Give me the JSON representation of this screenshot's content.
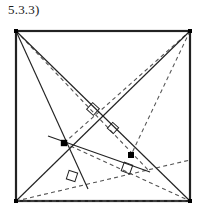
{
  "figure": {
    "label": "5.3.3)",
    "label_position": {
      "x": 8,
      "y": 2
    },
    "canvas": {
      "width": 206,
      "height": 221,
      "background": "#ffffff"
    },
    "stroke_color": "#222222",
    "dash_color": "#555555",
    "point_color": "#000000"
  },
  "square": {
    "name": "outer-square",
    "stroke": "#222222",
    "stroke_width": 2.2,
    "corners": {
      "top_left": {
        "x": 16,
        "y": 31
      },
      "top_right": {
        "x": 190,
        "y": 31
      },
      "bottom_left": {
        "x": 16,
        "y": 201
      },
      "bottom_right": {
        "x": 190,
        "y": 201
      }
    }
  },
  "solid_lines": [
    {
      "name": "diagonal-tl-br",
      "x1": 16,
      "y1": 31,
      "x2": 190,
      "y2": 201
    },
    {
      "name": "line-tr-to-bl",
      "x1": 190,
      "y1": 31,
      "x2": 16,
      "y2": 201
    },
    {
      "name": "cevian-tl-down",
      "x1": 16,
      "y1": 31,
      "x2": 88,
      "y2": 189
    },
    {
      "name": "segment-node-to-right",
      "x1": 48,
      "y1": 136,
      "x2": 150,
      "y2": 172
    }
  ],
  "dashed_lines": [
    {
      "name": "dashed-tl-to-lower-right",
      "x1": 16,
      "y1": 31,
      "x2": 150,
      "y2": 172
    },
    {
      "name": "dashed-tr-to-node-q",
      "x1": 190,
      "y1": 31,
      "x2": 131,
      "y2": 155
    },
    {
      "name": "dashed-bl-to-br",
      "x1": 16,
      "y1": 201,
      "x2": 190,
      "y2": 201
    },
    {
      "name": "dashed-bl-diag-to-right",
      "x1": 16,
      "y1": 201,
      "x2": 190,
      "y2": 160
    },
    {
      "name": "dashed-node-p-to-tr",
      "x1": 64,
      "y1": 143,
      "x2": 190,
      "y2": 31
    },
    {
      "name": "dashed-node-p-to-br",
      "x1": 64,
      "y1": 143,
      "x2": 190,
      "y2": 201
    }
  ],
  "points": [
    {
      "name": "point-p-center",
      "x": 64,
      "y": 143,
      "radius": 3.2,
      "label": ""
    },
    {
      "name": "point-q-right",
      "x": 131,
      "y": 155,
      "radius": 3.0,
      "label": ""
    }
  ],
  "right_angle_markers": [
    {
      "name": "right-angle-upper",
      "cx": 93,
      "cy": 109,
      "size": 9,
      "rotation": 42
    },
    {
      "name": "right-angle-mid-left",
      "cx": 113,
      "cy": 128,
      "size": 8,
      "rotation": 42
    },
    {
      "name": "right-angle-lower-left",
      "cx": 72,
      "cy": 176,
      "size": 9,
      "rotation": 18
    },
    {
      "name": "right-angle-lower-right",
      "cx": 127,
      "cy": 168,
      "size": 9,
      "rotation": 20
    }
  ],
  "corner_dots": [
    {
      "name": "corner-dot-tl",
      "x": 16,
      "y": 31
    },
    {
      "name": "corner-dot-tr",
      "x": 190,
      "y": 31
    },
    {
      "name": "corner-dot-bl",
      "x": 16,
      "y": 201
    },
    {
      "name": "corner-dot-br",
      "x": 190,
      "y": 201
    }
  ]
}
